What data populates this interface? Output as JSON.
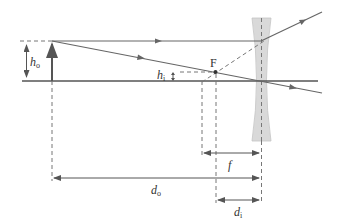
{
  "diagram": {
    "colors": {
      "ray": "#666666",
      "axis": "#555555",
      "dashed": "#777777",
      "lens_fill": "#d9d9d9",
      "lens_stroke": "#bbbbbb",
      "text": "#333333"
    },
    "labels": {
      "object_height": "h",
      "object_height_sub": "o",
      "image_height": "h",
      "image_height_sub": "i",
      "focal_point": "F",
      "focal_length": "f",
      "object_distance": "d",
      "object_distance_sub": "o",
      "image_distance": "d",
      "image_distance_sub": "i"
    }
  }
}
